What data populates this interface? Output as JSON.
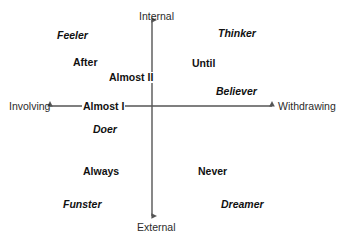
{
  "diagram": {
    "type": "quadrant-axes",
    "background_color": "#ffffff",
    "axis_color": "#555555",
    "text_color": "#111111"
  },
  "axes": {
    "vertical": {
      "top_label": "Internal",
      "bottom_label": "External",
      "arrow_top": "arrow-up",
      "arrow_bottom": "arrow-down"
    },
    "horizontal": {
      "left_label": "Involving",
      "right_label": "Withdrawing",
      "arrow_left": "arrow-left",
      "arrow_right": "arrow-right"
    }
  },
  "center_markers": [
    {
      "label": "Almost II",
      "style": "bold"
    },
    {
      "label": "Almost I",
      "style": "bold"
    }
  ],
  "quadrants": {
    "top_left": {
      "name": "Internal / Involving",
      "terms": [
        {
          "label": "Feeler",
          "style": "bold-italic"
        },
        {
          "label": "After",
          "style": "bold"
        }
      ]
    },
    "top_right": {
      "name": "Internal / Withdrawing",
      "terms": [
        {
          "label": "Thinker",
          "style": "bold-italic"
        },
        {
          "label": "Until",
          "style": "bold"
        },
        {
          "label": "Believer",
          "style": "bold-italic"
        }
      ]
    },
    "bottom_left": {
      "name": "External / Involving",
      "terms": [
        {
          "label": "Doer",
          "style": "bold-italic"
        },
        {
          "label": "Always",
          "style": "bold"
        },
        {
          "label": "Funster",
          "style": "bold-italic"
        }
      ]
    },
    "bottom_right": {
      "name": "External / Withdrawing",
      "terms": [
        {
          "label": "Never",
          "style": "bold"
        },
        {
          "label": "Dreamer",
          "style": "bold-italic"
        }
      ]
    }
  }
}
